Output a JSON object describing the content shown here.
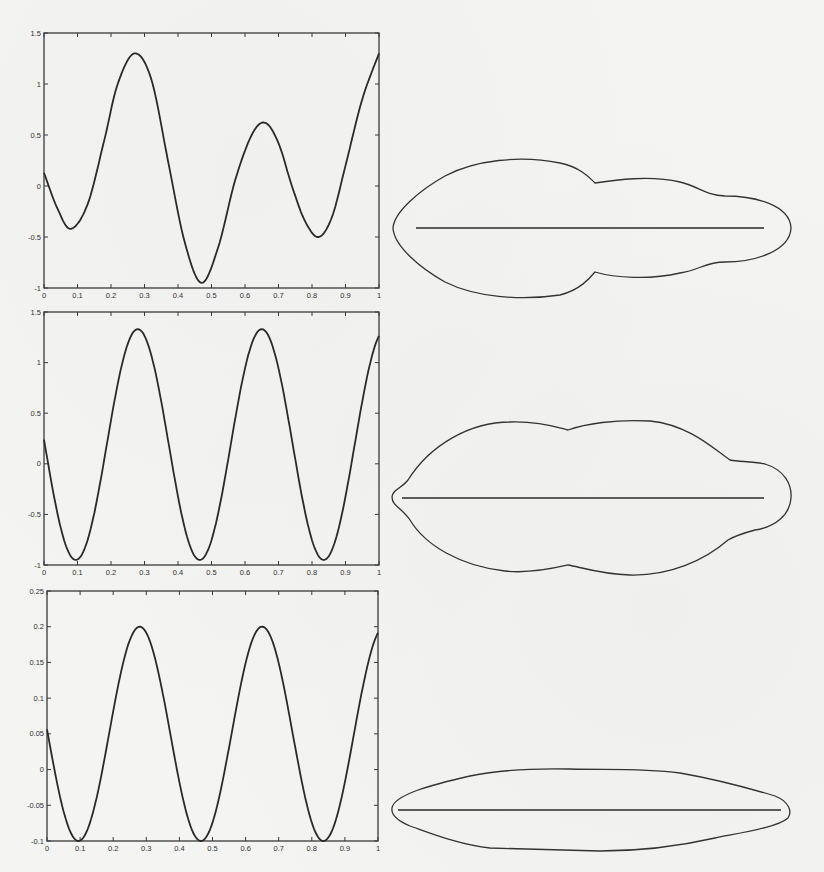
{
  "figure": {
    "panel_count": 3
  },
  "chart_data": [
    {
      "type": "line",
      "title": "",
      "xlabel": "",
      "ylabel": "",
      "xlim": [
        0,
        1
      ],
      "ylim": [
        -1,
        1.5
      ],
      "grid": false,
      "legend": null,
      "xticks": [
        "0",
        "0.1",
        "0.2",
        "0.3",
        "0.4",
        "0.5",
        "0.6",
        "0.7",
        "0.8",
        "0.9",
        "1"
      ],
      "yticks": [
        "-1",
        "-0.5",
        "0",
        "0.5",
        "1",
        "1.5"
      ],
      "x": [
        0,
        0.04,
        0.08,
        0.13,
        0.18,
        0.22,
        0.27,
        0.32,
        0.37,
        0.42,
        0.47,
        0.52,
        0.57,
        0.62,
        0.66,
        0.7,
        0.74,
        0.78,
        0.82,
        0.86,
        0.9,
        0.95,
        1.0
      ],
      "values": [
        0.13,
        -0.22,
        -0.42,
        -0.18,
        0.45,
        1.0,
        1.3,
        1.05,
        0.25,
        -0.55,
        -0.95,
        -0.6,
        0.05,
        0.5,
        0.62,
        0.42,
        0.0,
        -0.35,
        -0.5,
        -0.3,
        0.2,
        0.85,
        1.3
      ]
    },
    {
      "type": "line",
      "title": "",
      "xlabel": "",
      "ylabel": "",
      "xlim": [
        0,
        1
      ],
      "ylim": [
        -1,
        1.5
      ],
      "grid": false,
      "legend": null,
      "xticks": [
        "0",
        "0.1",
        "0.2",
        "0.3",
        "0.4",
        "0.5",
        "0.6",
        "0.7",
        "0.8",
        "0.9",
        "1"
      ],
      "yticks": [
        "-1",
        "-0.5",
        "0",
        "0.5",
        "1",
        "1.5"
      ],
      "x": [
        0,
        0.095,
        0.28,
        0.465,
        0.65,
        0.835,
        1.0
      ],
      "values": [
        0.2,
        -0.95,
        1.33,
        -0.95,
        1.33,
        -0.95,
        1.25
      ],
      "shape": "sinusoid",
      "period": 0.37,
      "amplitude": 1.14,
      "offset": 0.19
    },
    {
      "type": "line",
      "title": "",
      "xlabel": "",
      "ylabel": "",
      "xlim": [
        0,
        1
      ],
      "ylim": [
        -0.1,
        0.25
      ],
      "grid": false,
      "legend": null,
      "xticks": [
        "0",
        "0.1",
        "0.2",
        "0.3",
        "0.4",
        "0.5",
        "0.6",
        "0.7",
        "0.8",
        "0.9",
        "1"
      ],
      "yticks": [
        "-0.1",
        "-0.05",
        "0",
        "0.05",
        "0.1",
        "0.15",
        "0.2",
        "0.25"
      ],
      "x": [
        0,
        0.095,
        0.28,
        0.465,
        0.65,
        0.835,
        1.0
      ],
      "values": [
        0.05,
        -0.1,
        0.2,
        -0.1,
        0.2,
        -0.1,
        0.19
      ],
      "shape": "sinusoid",
      "period": 0.37,
      "amplitude": 0.15,
      "offset": 0.05
    }
  ],
  "shapes": [
    {
      "label": "closed-curve-shape-1",
      "description": "elongated closed curve with horizontal axis segment, wider on left"
    },
    {
      "label": "closed-curve-shape-2",
      "description": "lobed closed curve with horizontal axis segment"
    },
    {
      "label": "closed-curve-shape-3",
      "description": "thin elongated closed curve with horizontal axis segment"
    }
  ]
}
